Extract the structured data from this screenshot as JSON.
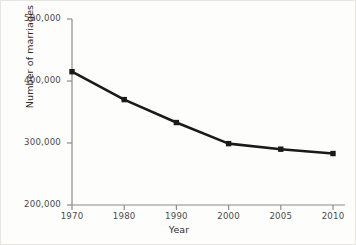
{
  "chart_data": {
    "type": "line",
    "title": "",
    "xlabel": "Year",
    "ylabel": "Number of marriages",
    "categories": [
      "1970",
      "1980",
      "1990",
      "2000",
      "2005",
      "2010"
    ],
    "values": [
      415000,
      370000,
      333000,
      299000,
      290000,
      283000
    ],
    "series": [
      {
        "name": "Number of marriages",
        "values": [
          415000,
          370000,
          333000,
          299000,
          290000,
          283000
        ]
      }
    ],
    "ylim": [
      200000,
      500000
    ],
    "yticks": [
      "200,000",
      "300,000",
      "400,000",
      "500,000"
    ],
    "ytick_values": [
      200000,
      300000,
      400000,
      500000
    ],
    "xticks": [
      "1970",
      "1980",
      "1990",
      "2000",
      "2005",
      "2010"
    ],
    "grid": false,
    "legend": false,
    "legend_position": "none",
    "marker": "square",
    "line_color": "#1a1a1a",
    "marker_color": "#1a1a1a",
    "axis_color": "#8c8c8c",
    "background_color": "#fdfdfc"
  },
  "axes": {
    "y_title": "Number of marriages",
    "x_title": "Year"
  }
}
